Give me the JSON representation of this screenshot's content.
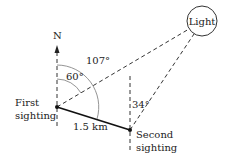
{
  "diagram": {
    "north_label": "N",
    "light_label": "Light",
    "first_sighting": [
      "First",
      "sighting"
    ],
    "second_sighting": [
      "Second",
      "sighting"
    ],
    "distance_label": "1.5 km",
    "angles": {
      "inner": "60°",
      "outer": "107°",
      "second": "34°"
    }
  }
}
